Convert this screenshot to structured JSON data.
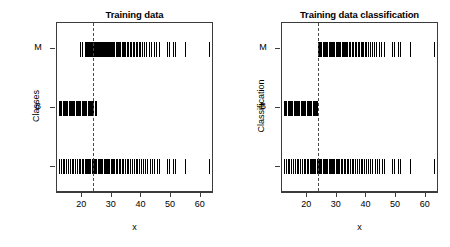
{
  "figure": {
    "background": "#ffffff",
    "axis_color": "#3c3c3c",
    "mark_color": "#000000",
    "cutline_color": "#4a4a4a",
    "width": 450,
    "height": 247
  },
  "panels": [
    {
      "title": "Training data",
      "ylabel": "Classes",
      "xlabel": "x"
    },
    {
      "title": "Training data classification",
      "ylabel": "Classification",
      "xlabel": "x"
    }
  ],
  "axis": {
    "x_ticks": [
      20,
      30,
      40,
      50,
      60
    ],
    "x_tick_labels": [
      "20",
      "30",
      "40",
      "50",
      "60"
    ],
    "x_range": [
      11.5,
      64.5
    ],
    "y_tick_labels": [
      "M",
      "B",
      ""
    ],
    "y_tick_values": [
      3,
      2,
      1
    ],
    "y_range": [
      0.55,
      3.45
    ]
  },
  "chart_data": {
    "type": "scatter",
    "xlabel": "x",
    "ylabel": "Classes / Classification",
    "xlim": [
      11.5,
      64.5
    ],
    "ylim": [
      0.55,
      3.45
    ],
    "grid": false,
    "legend": null,
    "annotations": [
      {
        "type": "vline",
        "x": 23.5,
        "style": "dashed",
        "label": "decision threshold"
      }
    ],
    "yticks": {
      "values": [
        3,
        2,
        1
      ],
      "labels": [
        "M",
        "B",
        ""
      ]
    },
    "panels": [
      {
        "name": "Training data",
        "ylabel": "Classes",
        "series": [
          {
            "name": "M (row y=3)",
            "y": 3,
            "x": [
              19.2,
              20.1,
              20.8,
              21.3,
              21.7,
              22.0,
              22.3,
              22.6,
              22.9,
              23.2,
              23.5,
              23.8,
              24.1,
              24.4,
              24.7,
              25.0,
              25.3,
              25.6,
              25.9,
              26.2,
              26.5,
              26.8,
              27.1,
              27.4,
              27.7,
              28.0,
              28.3,
              28.6,
              28.9,
              29.2,
              29.5,
              29.8,
              30.1,
              30.5,
              30.9,
              31.3,
              31.7,
              32.1,
              32.5,
              32.9,
              33.3,
              33.7,
              34.1,
              34.6,
              35.1,
              35.6,
              36.1,
              36.6,
              37.1,
              37.6,
              38.1,
              38.6,
              39.1,
              39.6,
              40.2,
              40.8,
              41.6,
              42.4,
              43.2,
              44.1,
              45.0,
              45.8,
              48.6,
              49.4,
              50.6,
              51.4,
              54.7,
              62.8
            ]
          },
          {
            "name": "B (row y=2)",
            "y": 2,
            "x": [
              12.2,
              12.6,
              13.0,
              13.4,
              13.8,
              14.2,
              14.6,
              15.0,
              15.4,
              15.8,
              16.2,
              16.6,
              17.0,
              17.4,
              17.8,
              18.2,
              18.6,
              19.0,
              19.4,
              19.8,
              20.2,
              20.6,
              21.0,
              21.4,
              21.8,
              22.2,
              22.6,
              23.0,
              23.4,
              23.8,
              24.2,
              24.6
            ]
          },
          {
            "name": "all (row y=1)",
            "y": 1,
            "x": [
              12.2,
              12.8,
              13.4,
              14.0,
              14.6,
              15.2,
              15.8,
              16.4,
              17.0,
              17.6,
              18.2,
              18.8,
              19.4,
              20.0,
              20.4,
              20.8,
              21.2,
              21.6,
              22.0,
              22.4,
              22.8,
              23.2,
              23.6,
              24.0,
              24.4,
              24.8,
              25.2,
              25.6,
              26.0,
              26.4,
              26.8,
              27.2,
              27.6,
              28.0,
              28.4,
              28.8,
              29.2,
              29.6,
              30.0,
              30.4,
              30.9,
              31.4,
              31.9,
              32.4,
              32.9,
              33.4,
              33.9,
              34.4,
              35.0,
              35.6,
              36.2,
              36.8,
              37.4,
              38.0,
              38.6,
              39.2,
              39.8,
              40.4,
              41.2,
              42.0,
              42.8,
              43.6,
              44.4,
              45.2,
              46.0,
              48.6,
              49.4,
              50.6,
              51.4,
              54.7,
              62.8
            ]
          }
        ]
      },
      {
        "name": "Training data classification",
        "ylabel": "Classification",
        "series": [
          {
            "name": "M (row y=3)",
            "y": 3,
            "x": [
              23.6,
              24.0,
              24.4,
              24.8,
              25.2,
              25.6,
              26.0,
              26.4,
              26.8,
              27.2,
              27.6,
              28.0,
              28.4,
              28.8,
              29.2,
              29.6,
              30.0,
              30.4,
              30.8,
              31.2,
              31.6,
              32.0,
              32.4,
              32.8,
              33.2,
              33.6,
              34.0,
              34.5,
              35.0,
              35.5,
              36.0,
              36.5,
              37.0,
              37.5,
              38.0,
              38.5,
              39.0,
              39.5,
              40.0,
              40.6,
              41.2,
              41.8,
              42.6,
              43.4,
              44.2,
              45.0,
              45.8,
              48.6,
              49.4,
              50.6,
              51.4,
              54.7,
              62.8
            ]
          },
          {
            "name": "B (row y=2)",
            "y": 2,
            "x": [
              12.2,
              12.6,
              13.0,
              13.4,
              13.8,
              14.2,
              14.6,
              15.0,
              15.4,
              15.8,
              16.2,
              16.6,
              17.0,
              17.4,
              17.8,
              18.2,
              18.6,
              19.0,
              19.4,
              19.8,
              20.2,
              20.6,
              21.0,
              21.4,
              21.8,
              22.2,
              22.6,
              23.0,
              23.4
            ]
          },
          {
            "name": "all (row y=1)",
            "y": 1,
            "x": [
              12.2,
              12.8,
              13.4,
              14.0,
              14.6,
              15.2,
              15.8,
              16.4,
              17.0,
              17.6,
              18.2,
              18.8,
              19.4,
              20.0,
              20.4,
              20.8,
              21.2,
              21.6,
              22.0,
              22.4,
              22.8,
              23.2,
              23.6,
              24.0,
              24.4,
              24.8,
              25.2,
              25.6,
              26.0,
              26.4,
              26.8,
              27.2,
              27.6,
              28.0,
              28.4,
              28.8,
              29.2,
              29.6,
              30.0,
              30.4,
              30.9,
              31.4,
              31.9,
              32.4,
              32.9,
              33.4,
              33.9,
              34.4,
              35.0,
              35.6,
              36.2,
              36.8,
              37.4,
              38.0,
              38.6,
              39.2,
              39.8,
              40.4,
              41.2,
              42.0,
              42.8,
              43.6,
              44.4,
              45.2,
              46.0,
              48.6,
              49.4,
              50.6,
              51.4,
              54.7,
              62.8
            ]
          }
        ]
      }
    ]
  }
}
